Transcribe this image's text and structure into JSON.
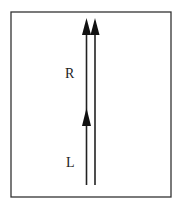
{
  "diagram": {
    "labels": {
      "R": "R",
      "L": "L"
    },
    "colors": {
      "stroke": "#222222",
      "background": "#ffffff"
    }
  }
}
